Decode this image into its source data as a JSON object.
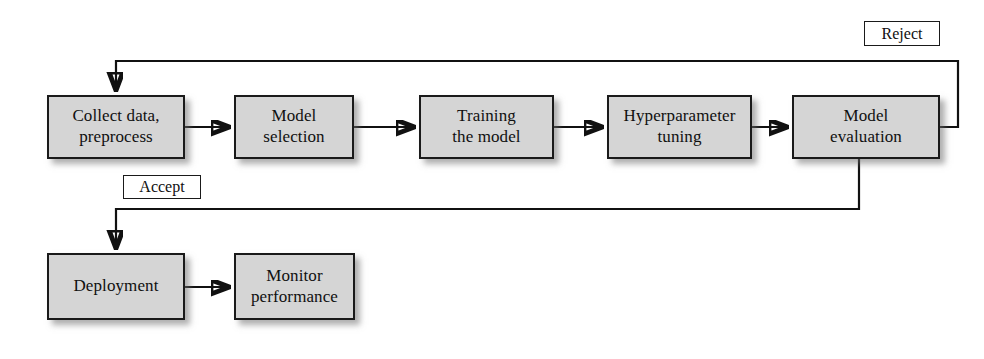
{
  "diagram": {
    "type": "flowchart",
    "canvas": {
      "width": 984,
      "height": 359
    },
    "style": {
      "node_fill": "#d5d5d5",
      "node_border": "#1a1a1a",
      "label_fill": "#ffffff",
      "line_color": "#111111",
      "background": "#ffffff"
    },
    "nodes": [
      {
        "id": "collect",
        "label": "Collect data,\npreprocess",
        "x": 47,
        "y": 95,
        "w": 138,
        "h": 64
      },
      {
        "id": "model-selection",
        "label": "Model\nselection",
        "x": 234,
        "y": 95,
        "w": 120,
        "h": 64
      },
      {
        "id": "training",
        "label": "Training\nthe model",
        "x": 419,
        "y": 95,
        "w": 135,
        "h": 64
      },
      {
        "id": "hyperparameter",
        "label": "Hyperparameter\ntuning",
        "x": 607,
        "y": 95,
        "w": 145,
        "h": 64
      },
      {
        "id": "evaluation",
        "label": "Model\nevaluation",
        "x": 792,
        "y": 95,
        "w": 148,
        "h": 64
      },
      {
        "id": "deployment",
        "label": "Deployment",
        "x": 47,
        "y": 253,
        "w": 138,
        "h": 67
      },
      {
        "id": "monitor",
        "label": "Monitor\nperformance",
        "x": 234,
        "y": 253,
        "w": 121,
        "h": 67
      }
    ],
    "edge_labels": [
      {
        "id": "reject",
        "label": "Reject",
        "x": 864,
        "y": 21,
        "w": 76,
        "h": 25
      },
      {
        "id": "accept",
        "label": "Accept",
        "x": 123,
        "y": 175,
        "w": 78,
        "h": 24
      }
    ],
    "edges": [
      {
        "id": "collect-to-model-selection",
        "from": "collect",
        "to": "model-selection",
        "kind": "arrow-right"
      },
      {
        "id": "model-selection-to-training",
        "from": "model-selection",
        "to": "training",
        "kind": "arrow-right"
      },
      {
        "id": "training-to-hyperparameter",
        "from": "training",
        "to": "hyperparameter",
        "kind": "arrow-right"
      },
      {
        "id": "hyperparameter-to-evaluation",
        "from": "hyperparameter",
        "to": "evaluation",
        "kind": "arrow-right"
      },
      {
        "id": "evaluation-reject-to-collect",
        "from": "evaluation",
        "to": "collect",
        "kind": "feedback-top",
        "label": "Reject"
      },
      {
        "id": "evaluation-accept-to-deployment",
        "from": "evaluation",
        "to": "deployment",
        "kind": "feedback-bottom",
        "label": "Accept"
      },
      {
        "id": "deployment-to-monitor",
        "from": "deployment",
        "to": "monitor",
        "kind": "arrow-right"
      }
    ]
  }
}
